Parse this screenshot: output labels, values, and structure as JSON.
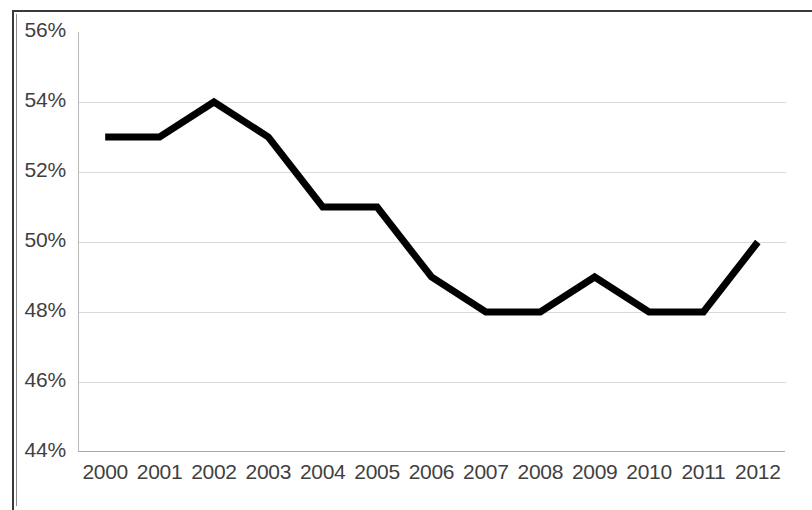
{
  "chart_data": {
    "type": "line",
    "title": "",
    "subtitle": "",
    "xlabel": "",
    "ylabel": "",
    "categories": [
      "2000",
      "2001",
      "2002",
      "2003",
      "2004",
      "2005",
      "2006",
      "2007",
      "2008",
      "2009",
      "2010",
      "2011",
      "2012"
    ],
    "values": [
      53,
      53,
      54,
      53,
      51,
      51,
      49,
      48,
      48,
      49,
      48,
      48,
      50
    ],
    "value_suffix": "%",
    "series": [
      {
        "name": "",
        "values": [
          53,
          53,
          54,
          53,
          51,
          51,
          49,
          48,
          48,
          49,
          48,
          48,
          50
        ]
      }
    ],
    "ylim": [
      44,
      56
    ],
    "ytick_values": [
      56,
      54,
      52,
      50,
      48,
      46,
      44
    ],
    "ytick_labels": [
      "56%",
      "54%",
      "52%",
      "50%",
      "48%",
      "46%",
      "44%"
    ],
    "xtick_labels": [
      "2000",
      "2001",
      "2002",
      "2003",
      "2004",
      "2005",
      "2006",
      "2007",
      "2008",
      "2009",
      "2010",
      "2011",
      "2012"
    ],
    "grid": true,
    "grid_axis": "y",
    "legend": false,
    "legend_position": "none",
    "line_color": "#000000",
    "line_width": 7,
    "gridline_color": "#d9d9d9",
    "axis_color": "#a8a8a8",
    "tick_label_color": "#3f3f3f",
    "background_color": "#ffffff",
    "markers": false,
    "annotations": []
  }
}
